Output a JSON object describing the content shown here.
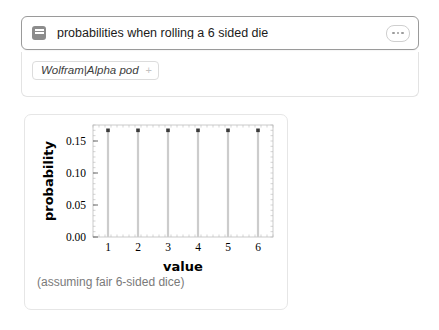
{
  "query_bar": {
    "icon": "query-block-icon",
    "text": "probabilities when rolling a 6 sided die",
    "menu_icon": "ellipsis-icon"
  },
  "pod_panel": {
    "tag_label": "Wolfram|Alpha pod",
    "tag_plus": "+"
  },
  "chart_card": {
    "caption": "(assuming fair 6-sided dice)"
  },
  "chart_data": {
    "type": "bar",
    "title": "",
    "xlabel": "value",
    "ylabel": "probability",
    "categories": [
      "1",
      "2",
      "3",
      "4",
      "5",
      "6"
    ],
    "values": [
      0.1667,
      0.1667,
      0.1667,
      0.1667,
      0.1667,
      0.1667
    ],
    "xtick_labels": [
      "1",
      "2",
      "3",
      "4",
      "5",
      "6"
    ],
    "ytick_labels": [
      "0.00",
      "0.05",
      "0.10",
      "0.15"
    ],
    "ytick_values": [
      0.0,
      0.05,
      0.1,
      0.15
    ],
    "ylim": [
      0.0,
      0.175
    ],
    "xlim": [
      0.5,
      6.5
    ],
    "grid": false,
    "legend": "none",
    "marker": "square",
    "stem_color": "#cccccc",
    "marker_color": "#3a3a3a"
  },
  "colors": {
    "page_background": "#ffffff",
    "input_border": "#9a9a9a",
    "panel_border": "#e3e3e3",
    "card_border": "#e6e6e6",
    "text_primary": "#1b1b1b",
    "text_muted": "#7a7a7a"
  }
}
